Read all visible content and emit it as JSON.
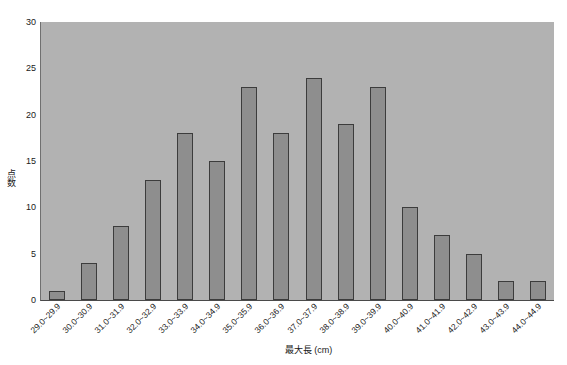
{
  "chart_data": {
    "type": "bar",
    "title": "",
    "subtitle": "",
    "xlabel": "最大長 (cm)",
    "ylabel": "点数",
    "categories": [
      "29.0~29.9",
      "30.0~30.9",
      "31.0~31.9",
      "32.0~32.9",
      "33.0~33.9",
      "34.0~34.9",
      "35.0~35.9",
      "36.0~36.9",
      "37.0~37.9",
      "38.0~38.9",
      "39.0~39.9",
      "40.0~40.9",
      "41.0~41.9",
      "42.0~42.9",
      "43.0~43.9",
      "44.0~44.9"
    ],
    "values": [
      1,
      4,
      8,
      13,
      18,
      15,
      23,
      18,
      24,
      19,
      23,
      10,
      7,
      5,
      2,
      2
    ],
    "ylim": [
      0,
      30
    ],
    "ytick_labels": [
      "0",
      "5",
      "10",
      "15",
      "20",
      "25",
      "30"
    ],
    "ytick_values": [
      0,
      5,
      10,
      15,
      20,
      25,
      30
    ],
    "grid": false,
    "legend": "none",
    "colors": {
      "bar_fill": "#8e8e8e",
      "bar_edge": "#3c3c3c",
      "plot_background": "#b2b2b2",
      "figure_background": "#ffffff",
      "text": "#202020"
    }
  }
}
